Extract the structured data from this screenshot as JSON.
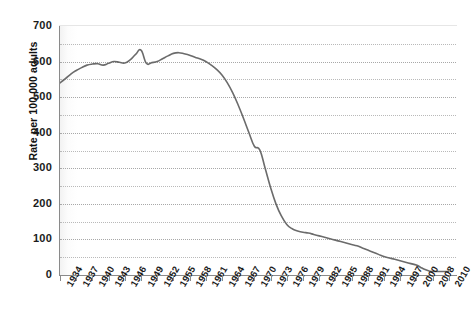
{
  "chart_data": {
    "type": "line",
    "title": "",
    "subtitle": "",
    "xlabel": "",
    "ylabel": "Rate per 100,000 adults",
    "ylim": [
      0,
      700
    ],
    "xlim": [
      1934,
      2010
    ],
    "grid": true,
    "legend": null,
    "y_major_step": 100,
    "y_minor_step": 50,
    "ytick_labels": [
      "700",
      "600",
      "500",
      "400",
      "300",
      "200",
      "100",
      "0"
    ],
    "ytick_values": [
      700,
      600,
      500,
      400,
      300,
      200,
      100,
      0
    ],
    "gridline_values": [
      650,
      600,
      550,
      500,
      450,
      400,
      350,
      300,
      250,
      200,
      150,
      100,
      50
    ],
    "xtick_labels": [
      "1934",
      "1937",
      "1940",
      "1943",
      "1946",
      "1949",
      "1952",
      "1955",
      "1958",
      "1961",
      "1964",
      "1967",
      "1970",
      "1973",
      "1976",
      "1979",
      "1982",
      "1985",
      "1988",
      "1991",
      "1994",
      "1997",
      "2000",
      "2008",
      "2010"
    ],
    "xtick_values": [
      1934,
      1937,
      1940,
      1943,
      1946,
      1949,
      1952,
      1955,
      1958,
      1961,
      1964,
      1967,
      1970,
      1973,
      1976,
      1979,
      1982,
      1985,
      1988,
      1991,
      1994,
      1997,
      2000,
      2008,
      2010
    ],
    "line_color": "#6b6b6b",
    "series": [
      {
        "name": "Rate per 100,000 adults",
        "x": [
          1934,
          1935,
          1936,
          1937,
          1938,
          1939,
          1940,
          1941,
          1942,
          1943,
          1944,
          1945,
          1946,
          1947,
          1948,
          1949,
          1950,
          1951,
          1952,
          1953,
          1954,
          1955,
          1956,
          1957,
          1958,
          1959,
          1960,
          1961,
          1962,
          1963,
          1964,
          1965,
          1966,
          1967,
          1968,
          1969,
          1970,
          1971,
          1972,
          1973,
          1974,
          1975,
          1976,
          1977,
          1978,
          1979,
          1980,
          1981,
          1982,
          1983,
          1984,
          1985,
          1986,
          1987,
          1988,
          1989,
          1990,
          1991,
          1992,
          1993,
          1994,
          1995,
          1996,
          1997,
          1998,
          1999,
          2000,
          2002,
          2004,
          2006,
          2008,
          2010
        ],
        "values": [
          540,
          552,
          565,
          575,
          583,
          590,
          593,
          594,
          590,
          595,
          600,
          598,
          596,
          605,
          620,
          632,
          595,
          597,
          600,
          608,
          616,
          623,
          625,
          622,
          618,
          612,
          607,
          600,
          590,
          578,
          562,
          540,
          512,
          478,
          440,
          400,
          362,
          352,
          300,
          246,
          200,
          166,
          142,
          130,
          124,
          120,
          118,
          114,
          110,
          106,
          102,
          98,
          94,
          90,
          86,
          82,
          76,
          70,
          64,
          58,
          52,
          48,
          44,
          40,
          36,
          32,
          28,
          22,
          16,
          12,
          10,
          10
        ]
      }
    ]
  },
  "axes": {
    "y_title": "Rate per 100,000 adults"
  }
}
